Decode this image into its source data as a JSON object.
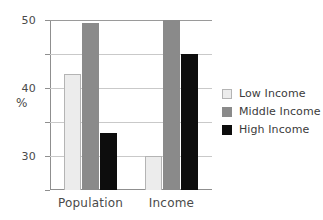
{
  "chart_data": {
    "type": "bar",
    "title": "",
    "xlabel": "",
    "ylabel": "%",
    "ylim": [
      0,
      50
    ],
    "yticks": [
      0,
      10,
      20,
      30,
      40,
      50
    ],
    "ytick_labels": [
      "0",
      "10",
      "20",
      "30",
      "40",
      "50"
    ],
    "grid": true,
    "legend_position": "right",
    "categories": [
      "Population",
      "Income"
    ],
    "series": [
      {
        "name": "Low Income",
        "color": "#ececec",
        "values": [
          34,
          10
        ]
      },
      {
        "name": "Middle Income",
        "color": "#8a8a8a",
        "values": [
          49,
          50
        ]
      },
      {
        "name": "High Income",
        "color": "#0d0d0d",
        "values": [
          16.7,
          40
        ]
      }
    ]
  },
  "axis": {
    "y_title": "%"
  },
  "legend": {
    "entries": [
      {
        "label": "Low Income"
      },
      {
        "label": "Middle Income"
      },
      {
        "label": "High Income"
      }
    ]
  }
}
